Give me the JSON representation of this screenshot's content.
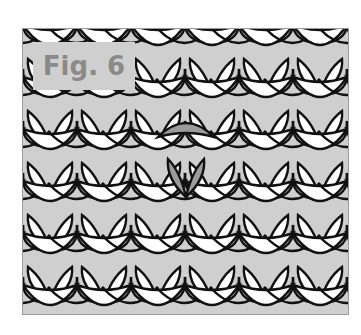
{
  "figure": {
    "label": "Fig. 6",
    "colors": {
      "stroke": "#111111",
      "fill": "#ffffff",
      "gap": "#cfcfcf",
      "highlight": "#9c9c9c",
      "label_bg": "#cfcfcf",
      "label_text": "#8a8a8a",
      "frame": "#9a9a9a"
    },
    "rows": 6,
    "stitches_per_row": 7,
    "highlighted_stitch": {
      "row": 2,
      "col": 3
    }
  }
}
